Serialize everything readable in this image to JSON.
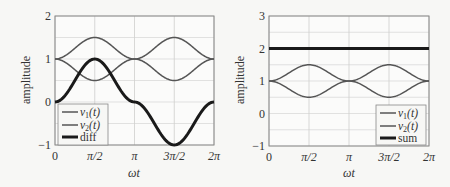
{
  "chart_data": [
    {
      "type": "line",
      "title": "",
      "xlabel": "ωt",
      "ylabel": "amplitude",
      "xlim": [
        0,
        6.2832
      ],
      "ylim": [
        -1,
        2
      ],
      "grid": true,
      "x_ticks": [
        0,
        1.5708,
        3.1416,
        4.7124,
        6.2832
      ],
      "x_tick_labels": [
        "0",
        "π/2",
        "π",
        "3π/2",
        "2π"
      ],
      "y_ticks": [
        -1,
        0,
        1,
        2
      ],
      "y_tick_labels": [
        "−1",
        "0",
        "1",
        "2"
      ],
      "legend_position": "lower left",
      "series": [
        {
          "name": "v1(t)",
          "expr": "1 + 0.5*sin(ωt)... (peaks 1.5 at π/2, 3π/2)",
          "x": [
            0,
            1.5708,
            3.1416,
            4.7124,
            6.2832
          ],
          "values": [
            1,
            1.5,
            1,
            1.5,
            1
          ],
          "color": "#555555",
          "width": 1.5
        },
        {
          "name": "v2(t)",
          "x": [
            0,
            1.5708,
            3.1416,
            4.7124,
            6.2832
          ],
          "values": [
            1,
            0.5,
            1,
            0.5,
            1
          ],
          "color": "#555555",
          "width": 1.5
        },
        {
          "name": "diff",
          "x": [
            0,
            1.5708,
            3.1416,
            4.7124,
            6.2832
          ],
          "values": [
            0,
            1,
            0,
            -1,
            0
          ],
          "color": "#1a1a1a",
          "width": 3
        }
      ]
    },
    {
      "type": "line",
      "title": "",
      "xlabel": "ωt",
      "ylabel": "amplitude",
      "xlim": [
        0,
        6.2832
      ],
      "ylim": [
        -1,
        3
      ],
      "grid": true,
      "x_ticks": [
        0,
        1.5708,
        3.1416,
        4.7124,
        6.2832
      ],
      "x_tick_labels": [
        "0",
        "π/2",
        "π",
        "3π/2",
        "2π"
      ],
      "y_ticks": [
        -1,
        0,
        1,
        2,
        3
      ],
      "y_tick_labels": [
        "−1",
        "0",
        "1",
        "2",
        "3"
      ],
      "legend_position": "lower right",
      "series": [
        {
          "name": "v1(t)",
          "x": [
            0,
            1.5708,
            3.1416,
            4.7124,
            6.2832
          ],
          "values": [
            1,
            1.5,
            1,
            1.5,
            1
          ],
          "color": "#555555",
          "width": 1.5
        },
        {
          "name": "v2(t)",
          "x": [
            0,
            1.5708,
            3.1416,
            4.7124,
            6.2832
          ],
          "values": [
            1,
            0.5,
            1,
            0.5,
            1
          ],
          "color": "#555555",
          "width": 1.5
        },
        {
          "name": "sum",
          "x": [
            0,
            1.5708,
            3.1416,
            4.7124,
            6.2832
          ],
          "values": [
            2,
            2,
            2,
            2,
            2
          ],
          "color": "#1a1a1a",
          "width": 3
        }
      ]
    }
  ],
  "left": {
    "ylabel": "amplitude",
    "xlabel": "ωt",
    "legend": {
      "v1_base": "v",
      "v1_sub": "1",
      "v1_arg": "(t)",
      "v2_base": "v",
      "v2_sub": "2",
      "v2_arg": "(t)",
      "third": "diff"
    }
  },
  "right": {
    "ylabel": "amplitude",
    "xlabel": "ωt",
    "legend": {
      "v1_base": "v",
      "v1_sub": "1",
      "v1_arg": "(t)",
      "v2_base": "v",
      "v2_sub": "2",
      "v2_arg": "(t)",
      "third": "sum"
    }
  }
}
